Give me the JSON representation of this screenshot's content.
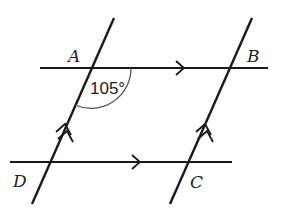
{
  "diagram": {
    "type": "parallelogram-with-transversals",
    "points": [
      {
        "name": "A",
        "x": 91,
        "y": 68,
        "label_x": 68,
        "label_y": 62
      },
      {
        "name": "B",
        "x": 229,
        "y": 68,
        "label_x": 247,
        "label_y": 62
      },
      {
        "name": "C",
        "x": 187,
        "y": 162,
        "label_x": 190,
        "label_y": 188
      },
      {
        "name": "D",
        "x": 49,
        "y": 162,
        "label_x": 13,
        "label_y": 187
      }
    ],
    "labels": {
      "A": "A",
      "B": "B",
      "C": "C",
      "D": "D",
      "angle_A": "105°"
    },
    "angle": {
      "vertex": "A",
      "value_deg": 105
    },
    "parallel_marks": {
      "horizontal_lines": "single-arrow",
      "slanted_lines": "double-arrow"
    },
    "stroke_color": "#1a1a1a",
    "arc_color": "#555555"
  }
}
